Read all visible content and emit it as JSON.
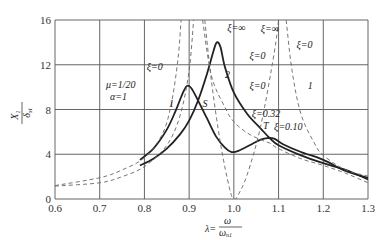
{
  "chart_data": {
    "type": "line",
    "title": "",
    "xlabel": "λ = ω / ω_n1",
    "xlabel_parts": {
      "lhs": "λ=",
      "num": "ω",
      "den": "ω",
      "den_sub": "n1"
    },
    "ylabel": "X1 / δst",
    "ylabel_parts": {
      "num": "X",
      "num_sub": "1",
      "den": "δ",
      "den_sub": "st"
    },
    "xlim": [
      0.6,
      1.3
    ],
    "ylim": [
      0,
      16
    ],
    "x_ticks": [
      "0.6",
      "0.7",
      "0.8",
      "0.9",
      "1.0",
      "1.1",
      "1.2",
      "1.3"
    ],
    "y_ticks": [
      "0",
      "4",
      "8",
      "12",
      "16"
    ],
    "grid": true,
    "parameters": {
      "mu": "μ=1/20",
      "alpha": "α=1"
    },
    "series": [
      {
        "name": "ξ=0.32",
        "style": "solid",
        "label": "2",
        "x": [
          0.79,
          0.82,
          0.85,
          0.88,
          0.9,
          0.92,
          0.94,
          0.955,
          0.962,
          0.97,
          0.98,
          1.0,
          1.03,
          1.06,
          1.08,
          1.1,
          1.15,
          1.2,
          1.25,
          1.3
        ],
        "y": [
          3.0,
          3.6,
          4.5,
          5.8,
          7.0,
          8.8,
          11.2,
          13.3,
          14.0,
          13.6,
          11.8,
          9.5,
          7.6,
          6.3,
          5.45,
          4.8,
          3.9,
          3.2,
          2.6,
          1.75
        ]
      },
      {
        "name": "ξ=0.10",
        "style": "solid",
        "label": "1",
        "x": [
          0.79,
          0.82,
          0.85,
          0.87,
          0.885,
          0.895,
          0.905,
          0.92,
          0.94,
          0.96,
          0.98,
          0.995,
          1.01,
          1.04,
          1.06,
          1.075,
          1.09,
          1.11,
          1.15,
          1.2,
          1.25,
          1.3
        ],
        "y": [
          3.5,
          4.5,
          6.2,
          7.9,
          9.4,
          10.1,
          9.9,
          8.8,
          7.2,
          5.6,
          4.6,
          4.2,
          4.3,
          4.9,
          5.3,
          5.45,
          5.4,
          4.9,
          4.2,
          3.5,
          2.5,
          1.9
        ]
      },
      {
        "name": "ξ=0",
        "style": "dashed",
        "label": "1",
        "x": [
          0.6,
          0.7,
          0.75,
          0.8,
          0.84,
          0.86,
          0.875,
          0.882
        ],
        "y": [
          1.2,
          1.9,
          2.6,
          3.7,
          5.8,
          8.5,
          12.5,
          16
        ],
        "x2": [
          0.935,
          0.95,
          0.97,
          0.99,
          1.0,
          1.01,
          1.03,
          1.06,
          1.09,
          1.1
        ],
        "y2": [
          16,
          10.5,
          5.0,
          1.0,
          0.0,
          0.4,
          2.2,
          6.5,
          13.0,
          16
        ],
        "x3": [
          1.117,
          1.13,
          1.15,
          1.18,
          1.2,
          1.25,
          1.3
        ],
        "y3": [
          16,
          11.5,
          7.6,
          5.0,
          3.9,
          2.6,
          2.05
        ]
      },
      {
        "name": "ξ=∞",
        "style": "dashed",
        "label": "2",
        "x": [
          0.6,
          0.7,
          0.75,
          0.8,
          0.85,
          0.88,
          0.9,
          0.91
        ],
        "y": [
          1.15,
          1.45,
          2.0,
          2.9,
          4.8,
          7.5,
          11.5,
          16
        ],
        "x2": [
          0.93,
          0.95,
          0.98,
          1.0,
          1.03,
          1.06,
          1.08,
          1.1,
          1.15,
          1.2,
          1.25,
          1.3
        ],
        "y2": [
          16,
          11.0,
          8.2,
          6.9,
          5.9,
          5.3,
          5.0,
          4.5,
          3.6,
          3.0,
          2.3,
          1.45
        ]
      }
    ],
    "annotations": [
      {
        "text": "ξ=0",
        "x": 0.805,
        "y": 11.5
      },
      {
        "text": "ξ=∞",
        "x": 0.985,
        "y": 15.0
      },
      {
        "text": "ξ=∞",
        "x": 1.06,
        "y": 14.9
      },
      {
        "text": "ξ=0",
        "x": 1.035,
        "y": 12.5
      },
      {
        "text": "ξ=0",
        "x": 1.14,
        "y": 13.5
      },
      {
        "text": "ξ=0",
        "x": 1.035,
        "y": 9.8
      },
      {
        "text": "ξ=0.32",
        "x": 1.04,
        "y": 7.3
      },
      {
        "text": "ξ=0.10",
        "x": 1.09,
        "y": 6.2
      },
      {
        "text": "S",
        "x": 0.93,
        "y": 8.2
      },
      {
        "text": "T",
        "x": 1.065,
        "y": 6.3
      },
      {
        "text": "1",
        "x": 0.855,
        "y": 8.2
      },
      {
        "text": "2",
        "x": 0.98,
        "y": 10.8
      },
      {
        "text": "1",
        "x": 1.165,
        "y": 9.8
      }
    ]
  }
}
